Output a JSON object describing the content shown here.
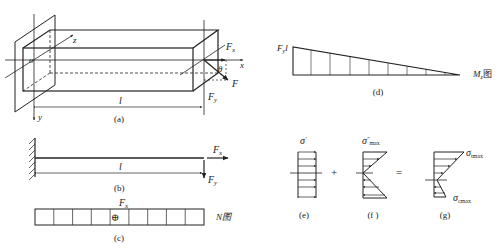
{
  "figure": {
    "panels": [
      {
        "id": "a",
        "caption": "(a)",
        "labels": {
          "origin": "o",
          "axis_z": "z",
          "axis_x": "x",
          "axis_y": "y",
          "length": "l",
          "force": "F",
          "force_x": "F",
          "force_x_sub": "x",
          "force_y": "F",
          "force_y_sub": "y",
          "angle": "θ"
        }
      },
      {
        "id": "b",
        "caption": "(b)",
        "labels": {
          "length": "l",
          "force_x": "F",
          "force_x_sub": "x",
          "force_y": "F",
          "force_y_sub": "y"
        }
      },
      {
        "id": "c",
        "caption": "(c)",
        "labels": {
          "force_x": "F",
          "force_x_sub": "x",
          "sign": "⊕",
          "diagram_name": "N图"
        },
        "cells": 9
      },
      {
        "id": "d",
        "caption": "(d)",
        "labels": {
          "max_value": "F",
          "max_value_sub": "y",
          "max_value_suffix": "l",
          "diagram_name": "M",
          "diagram_name_sub": "z",
          "diagram_suffix": "图"
        }
      },
      {
        "id": "e",
        "caption": "(e)",
        "labels": {
          "sigma": "σ",
          "sup": "′"
        }
      },
      {
        "id": "f",
        "caption": "(f )",
        "labels": {
          "sigma": "σ",
          "sup": "″",
          "sub": "max"
        }
      },
      {
        "id": "g",
        "caption": "(g)",
        "labels": {
          "sigma_t": "σ",
          "sigma_t_sub": "tmax",
          "sigma_c": "σ",
          "sigma_c_sub": "cmax"
        }
      }
    ],
    "operators": {
      "plus": "+",
      "equals": "="
    }
  }
}
